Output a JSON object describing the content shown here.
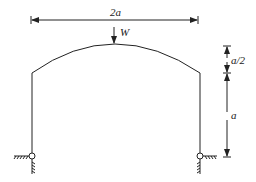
{
  "figure": {
    "type": "structural-frame",
    "labels": {
      "span": "2a",
      "load": "W",
      "rise": "a/2",
      "leg_height": "a"
    },
    "colors": {
      "line": "#222222",
      "background": "#ffffff"
    },
    "geometry": {
      "span_dim_y": 20,
      "left_x": 32,
      "right_x": 200,
      "crown_x": 114,
      "crown_y": 44,
      "spring_y": 73,
      "base_y": 156,
      "right_dim_x": 227
    }
  }
}
